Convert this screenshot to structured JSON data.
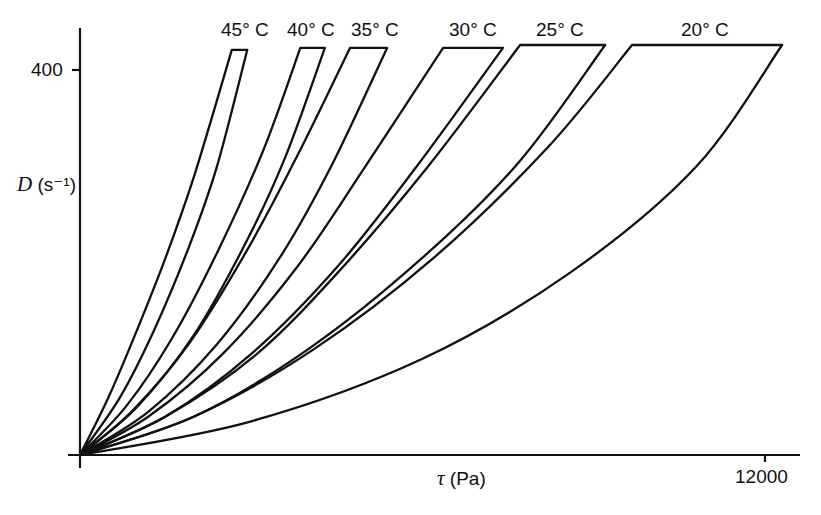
{
  "chart_data": {
    "type": "line",
    "title": "",
    "xlabel": "τ (Pa)",
    "ylabel": "D (s⁻¹)",
    "xlim": [
      0,
      12300
    ],
    "ylim": [
      0,
      425
    ],
    "x_ticks": [
      {
        "value": 12000,
        "label": "12000"
      }
    ],
    "y_ticks": [
      {
        "value": 400,
        "label": "400"
      }
    ],
    "grid": false,
    "legend": "none (curves labeled directly at top)",
    "series": [
      {
        "name": "45° C",
        "label": "45° C",
        "top_D": 421,
        "up_curve": {
          "tau": [
            0,
            500,
            1000,
            1500,
            2000,
            2660
          ],
          "D": [
            0,
            60,
            130,
            205,
            290,
            421
          ]
        },
        "down_curve": {
          "tau": [
            0,
            700,
            1300,
            1900,
            2400,
            2930
          ],
          "D": [
            0,
            60,
            130,
            215,
            300,
            421
          ]
        }
      },
      {
        "name": "40° C",
        "label": "40° C",
        "top_D": 423,
        "up_curve": {
          "tau": [
            0,
            800,
            1600,
            2400,
            3200,
            3860
          ],
          "D": [
            0,
            50,
            120,
            210,
            315,
            423
          ]
        },
        "down_curve": {
          "tau": [
            0,
            1000,
            2000,
            2900,
            3600,
            4290
          ],
          "D": [
            0,
            50,
            125,
            220,
            310,
            423
          ]
        }
      },
      {
        "name": "35° C",
        "label": "35° C",
        "top_D": 423,
        "up_curve": {
          "tau": [
            0,
            900,
            1900,
            2900,
            3800,
            4730
          ],
          "D": [
            0,
            45,
            115,
            210,
            310,
            423
          ]
        },
        "down_curve": {
          "tau": [
            0,
            1200,
            2400,
            3500,
            4400,
            5380
          ],
          "D": [
            0,
            45,
            115,
            205,
            300,
            423
          ]
        }
      },
      {
        "name": "30° C",
        "label": "30° C",
        "top_D": 423,
        "up_curve": {
          "tau": [
            0,
            1200,
            2500,
            3800,
            5000,
            6360
          ],
          "D": [
            0,
            40,
            105,
            195,
            300,
            423
          ]
        },
        "down_curve": {
          "tau": [
            0,
            1500,
            3000,
            4500,
            5900,
            7410
          ],
          "D": [
            0,
            40,
            105,
            195,
            300,
            423
          ]
        }
      },
      {
        "name": "25° C",
        "label": "25° C",
        "top_D": 426,
        "up_curve": {
          "tau": [
            0,
            1500,
            3100,
            4600,
            6100,
            7710
          ],
          "D": [
            0,
            40,
            105,
            195,
            300,
            426
          ]
        },
        "down_curve": {
          "tau": [
            0,
            2000,
            4000,
            6000,
            7700,
            9200
          ],
          "D": [
            0,
            40,
            110,
            205,
            305,
            426
          ]
        }
      },
      {
        "name": "20° C",
        "label": "20° C",
        "top_D": 426,
        "up_curve": {
          "tau": [
            0,
            2000,
            4100,
            6200,
            8200,
            9670
          ],
          "D": [
            0,
            40,
            110,
            205,
            320,
            426
          ]
        },
        "down_curve": {
          "tau": [
            0,
            3000,
            6000,
            8600,
            10800,
            12300
          ],
          "D": [
            0,
            35,
            100,
            190,
            300,
            426
          ]
        }
      }
    ]
  },
  "labels": {
    "t45": "45° C",
    "t40": "40° C",
    "t35": "35° C",
    "t30": "30° C",
    "t25": "25° C",
    "t20": "20° C",
    "y_tick_400": "400",
    "x_tick_12000": "12000",
    "y_axis_symbol": "D",
    "y_axis_unit": " (s⁻¹)",
    "x_axis_symbol": "τ",
    "x_axis_unit": " (Pa)"
  }
}
